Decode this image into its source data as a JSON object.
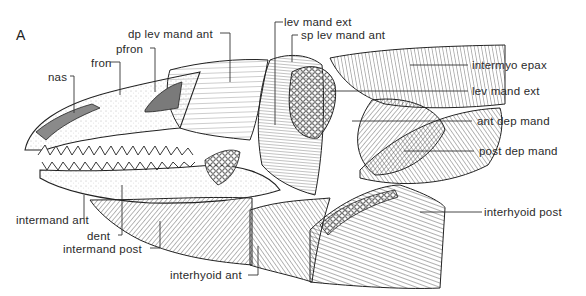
{
  "figure": {
    "panel_label": "A",
    "colors": {
      "ink": "#222222",
      "background": "#ffffff",
      "stipple": "#9a9a9a"
    }
  },
  "labels": {
    "dp_lev_mand_ant": "dp lev mand ant",
    "pfron": "pfron",
    "fron": "fron",
    "nas": "nas",
    "lev_mand_ext_top": "lev mand ext",
    "sp_lev_mand_ant": "sp lev mand ant",
    "intermyo_epax": "intermyo epax",
    "lev_mand_ext_right": "lev mand ext",
    "ant_dep_mand": "ant dep mand",
    "post_dep_mand": "post dep mand",
    "interhyoid_post": "interhyoid post",
    "intermand_ant": "intermand ant",
    "dent": "dent",
    "intermand_post": "intermand post",
    "interhyoid_ant": "interhyoid ant"
  }
}
